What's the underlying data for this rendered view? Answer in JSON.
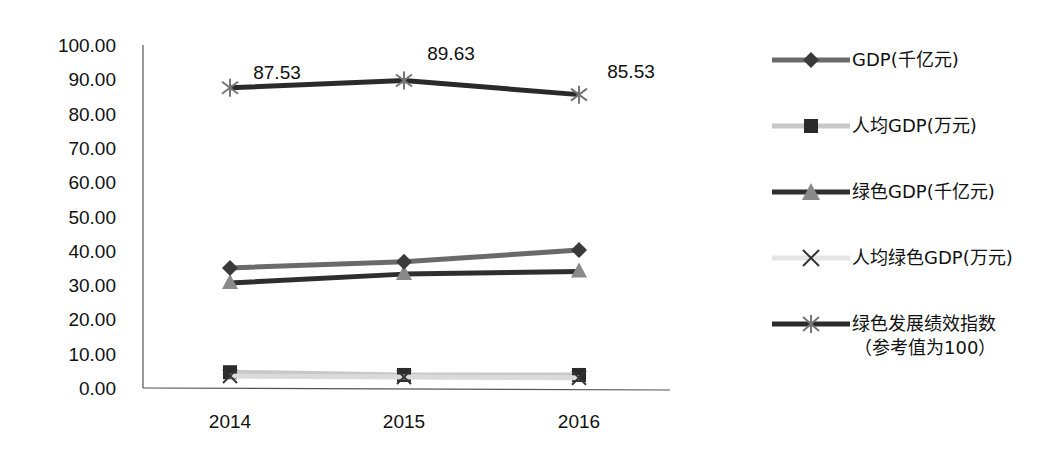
{
  "chart_data": {
    "type": "line",
    "title": "",
    "xlabel": "",
    "ylabel": "",
    "categories": [
      "2014",
      "2015",
      "2016"
    ],
    "ylim": [
      0,
      100
    ],
    "yticks": [
      "0.00",
      "10.00",
      "20.00",
      "30.00",
      "40.00",
      "50.00",
      "60.00",
      "70.00",
      "80.00",
      "90.00",
      "100.00"
    ],
    "grid": false,
    "legend_position": "right",
    "series": [
      {
        "name": "GDP(千亿元)",
        "values": [
          35.0,
          36.8,
          40.2
        ],
        "color": "#6a6a6a",
        "marker": "diamond",
        "marker_color": "#3a3a3a"
      },
      {
        "name": "人均GDP(万元)",
        "values": [
          4.6,
          3.8,
          3.8
        ],
        "color": "#c8c8c8",
        "marker": "square",
        "marker_color": "#2a2a2a"
      },
      {
        "name": "绿色GDP(千亿元)",
        "values": [
          30.6,
          33.2,
          34.0
        ],
        "color": "#2e2e2e",
        "marker": "triangle",
        "marker_color": "#8a8a8a"
      },
      {
        "name": "人均绿色GDP(万元)",
        "values": [
          3.5,
          3.2,
          3.0
        ],
        "color": "#dadada",
        "marker": "x",
        "marker_color": "#333333"
      },
      {
        "name": "绿色发展绩效指数（参考值为100）",
        "values": [
          87.53,
          89.63,
          85.53
        ],
        "color": "#2a2a2a",
        "marker": "star",
        "marker_color": "#777777",
        "data_labels": [
          "87.53",
          "89.63",
          "85.53"
        ]
      }
    ]
  },
  "legend": {
    "items": [
      {
        "label": "GDP(千亿元)"
      },
      {
        "label": "人均GDP(万元)"
      },
      {
        "label": "绿色GDP(千亿元)"
      },
      {
        "label": "人均绿色GDP(万元)"
      },
      {
        "label": "绿色发展绩效指数",
        "sub": "（参考值为100）"
      }
    ]
  }
}
